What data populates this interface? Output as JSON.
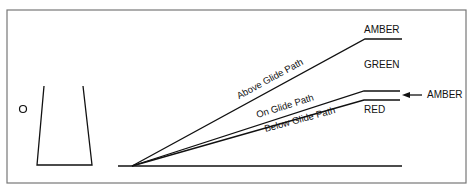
{
  "diagram": {
    "labels": {
      "amber_top": "AMBER",
      "green": "GREEN",
      "amber_right": "AMBER",
      "red": "RED",
      "above": "Above Glide Path",
      "on": "On Glide Path",
      "below": "Below Glide Path"
    },
    "colors": {
      "line": "#111111",
      "frame": "#777777",
      "background": "#ffffff"
    }
  }
}
